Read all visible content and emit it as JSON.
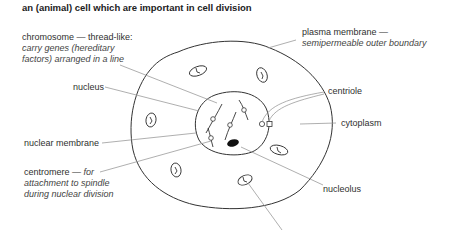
{
  "caption": "an (animal) cell which are important in cell division",
  "labels": {
    "chromosome": {
      "title": "chromosome — thread-like:",
      "desc_line1": "carry genes (hereditary",
      "desc_line2": "factors) arranged in a line"
    },
    "nucleus": "nucleus",
    "nuclear_membrane": "nuclear membrane",
    "centromere": {
      "title": "centromere — ",
      "title_italic": "for",
      "desc_line1": "attachment to spindle",
      "desc_line2": "during nuclear division"
    },
    "plasma_membrane": {
      "title": "plasma membrane —",
      "desc": "semipermeable outer boundary"
    },
    "centriole": "centriole",
    "cytoplasm": "cytoplasm",
    "nucleolus": "nucleolus"
  },
  "colors": {
    "outline": "#333333",
    "leader": "#9a9a9a",
    "nucleolus_fill": "#111111"
  }
}
